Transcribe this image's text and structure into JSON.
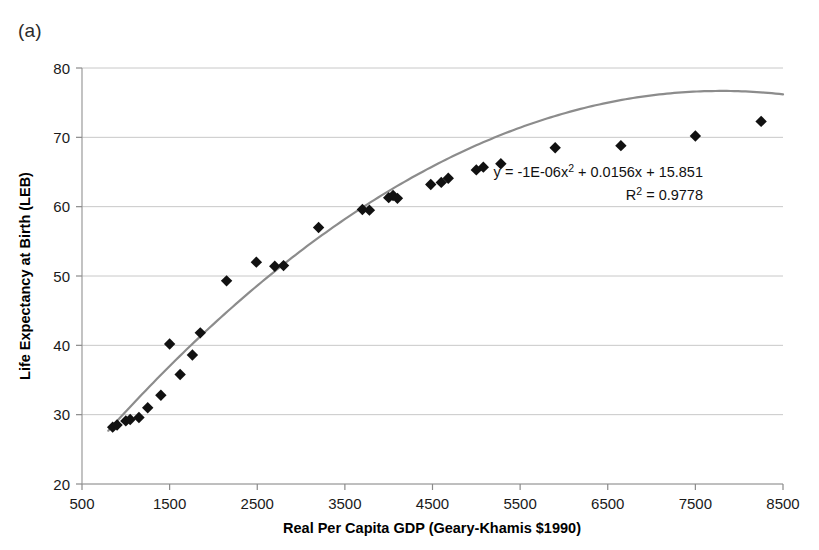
{
  "figure": {
    "panel_label": "(a)",
    "background_color": "#ffffff"
  },
  "chart_data": {
    "type": "scatter",
    "title": "",
    "subtitle": "",
    "xlabel": "Real Per Capita GDP (Geary-Khamis $1990)",
    "ylabel": "Life Expectancy at Birth (LEB)",
    "xlim": [
      500,
      8500
    ],
    "ylim": [
      20,
      80
    ],
    "xticks": [
      500,
      1500,
      2500,
      3500,
      4500,
      5500,
      6500,
      7500,
      8500
    ],
    "yticks": [
      20,
      30,
      40,
      50,
      60,
      70,
      80
    ],
    "xtick_labels": [
      "500",
      "1500",
      "2500",
      "3500",
      "4500",
      "5500",
      "6500",
      "7500",
      "8500"
    ],
    "ytick_labels": [
      "20",
      "30",
      "40",
      "50",
      "60",
      "70",
      "80"
    ],
    "grid": "horizontal",
    "grid_color": "#c8c8c8",
    "legend": "none",
    "marker_shape": "diamond",
    "marker_color": "#111111",
    "marker_size": 9,
    "series": [
      {
        "name": "Life expectancy vs GDP",
        "points": [
          [
            850,
            28.2
          ],
          [
            900,
            28.5
          ],
          [
            1000,
            29.1
          ],
          [
            1050,
            29.3
          ],
          [
            1150,
            29.6
          ],
          [
            1250,
            31.0
          ],
          [
            1400,
            32.8
          ],
          [
            1500,
            40.2
          ],
          [
            1620,
            35.8
          ],
          [
            1760,
            38.6
          ],
          [
            1850,
            41.8
          ],
          [
            2150,
            49.3
          ],
          [
            2490,
            52.0
          ],
          [
            2700,
            51.4
          ],
          [
            2800,
            51.5
          ],
          [
            3200,
            57.0
          ],
          [
            3700,
            59.6
          ],
          [
            3780,
            59.5
          ],
          [
            4000,
            61.3
          ],
          [
            4050,
            61.6
          ],
          [
            4100,
            61.2
          ],
          [
            4480,
            63.2
          ],
          [
            4600,
            63.5
          ],
          [
            4680,
            64.1
          ],
          [
            5000,
            65.3
          ],
          [
            5080,
            65.7
          ],
          [
            5280,
            66.2
          ],
          [
            5900,
            68.5
          ],
          [
            6650,
            68.8
          ],
          [
            7500,
            70.2
          ],
          [
            8250,
            72.3
          ]
        ]
      }
    ],
    "trendline": {
      "type": "polynomial",
      "order": 2,
      "color": "#8c8c8c",
      "width": 2.2,
      "coefficients": {
        "a": -1e-06,
        "b": 0.0156,
        "c": 15.851
      },
      "x_start": 800,
      "x_end": 8500,
      "equation_text": "y = -1E-06x",
      "equation_exponent": "2",
      "equation_tail": " + 0.0156x + 15.851",
      "r2_label": "R",
      "r2_exponent": "2",
      "r2_value": " = 0.9778",
      "r2": 0.9778
    }
  },
  "annotations": {
    "equation_line_1": "y = -1E-06x² + 0.0156x + 15.851",
    "equation_line_2": "R² = 0.9778"
  }
}
